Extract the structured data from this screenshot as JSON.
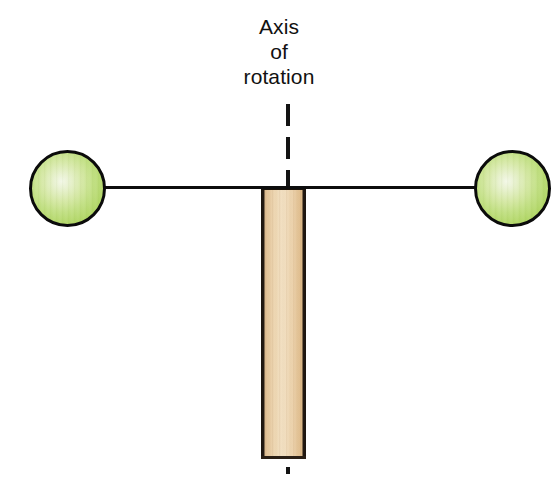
{
  "figure": {
    "name": "axis-of-rotation-diagram",
    "background_color": "#ffffff",
    "width": 559,
    "height": 488
  },
  "label": {
    "line1": "Axis",
    "line2": "of",
    "line3": "rotation",
    "full_text": "Axis of rotation",
    "color": "#111111"
  },
  "parts": {
    "axis_line": {
      "name": "axis-of-rotation-dashed-line",
      "style": "dashed",
      "orientation": "vertical",
      "color": "#131313"
    },
    "rod": {
      "name": "horizontal-rod",
      "orientation": "horizontal",
      "color": "#0d0d0d"
    },
    "post": {
      "name": "vertical-post",
      "material": "wood",
      "fill_color": "#f3e2c6",
      "edge_color": "#1c1510"
    },
    "ball_left": {
      "name": "left-sphere",
      "color": "#b2d768",
      "highlight_color": "#f3f8e8",
      "outline_color": "#0b0b0b"
    },
    "ball_right": {
      "name": "right-sphere",
      "color": "#b2d768",
      "highlight_color": "#f3f8e8",
      "outline_color": "#0b0b0b"
    }
  }
}
